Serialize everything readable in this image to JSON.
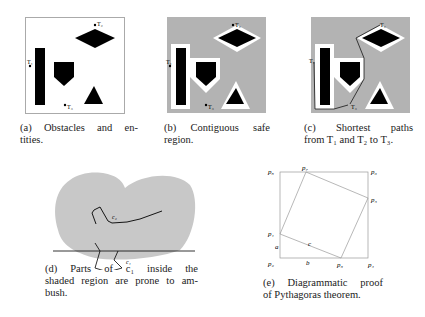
{
  "figures": {
    "a": {
      "labels": {
        "t1": "T₁",
        "t2": "T₂",
        "t3": "T₃"
      },
      "caption_lines": [
        "(a) Obstacles and en-",
        "tities."
      ]
    },
    "b": {
      "labels": {
        "t1": "T₁",
        "t2": "T₂",
        "t3": "T₃"
      },
      "caption_lines": [
        "(b) Contiguous safe",
        "region."
      ]
    },
    "c": {
      "labels": {
        "t1": "T₁",
        "t2": "T₂",
        "t3": "T₃"
      },
      "caption_lines": [
        "(c) Shortest paths",
        "from T₁ and T₂ to T₃."
      ]
    },
    "d": {
      "labels": {
        "c1": "c₁",
        "c2": "c₂"
      },
      "caption_lines": [
        "(d) Parts of c₁ inside the",
        "shaded region are prone to am-",
        "bush."
      ]
    },
    "e": {
      "labels": {
        "p1": "p₁",
        "p2": "p₂",
        "p3": "p₃",
        "p4": "p₄",
        "p5": "p₅",
        "p6": "p₆",
        "p7": "p₇",
        "p8": "p₈",
        "a": "a",
        "b": "b",
        "c": "c"
      },
      "caption_lines": [
        "(e) Diagrammatic proof",
        "of Pythagoras theorem."
      ]
    }
  },
  "colors": {
    "shade": "#b3b3b3",
    "obstacle": "#000000",
    "frame": "#9a9a9a",
    "blob": "#c8c8c8"
  }
}
